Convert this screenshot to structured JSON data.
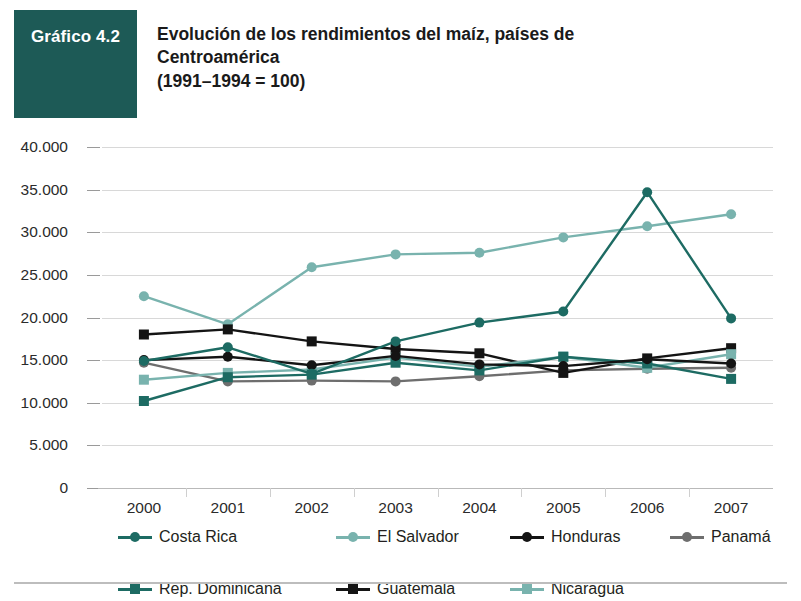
{
  "header": {
    "badge_label": "Gráfico 4.2",
    "title": "Evolución de los rendimientos del maíz, países de\nCentroamérica\n(1991–1994 = 100)",
    "badge_bg": "#1d5a56",
    "title_color": "#1a1a1a"
  },
  "colors": {
    "dark_teal": "#1d6b63",
    "light_teal": "#79b3ae",
    "black": "#141414",
    "gray": "#6e6e6e",
    "grid": "#d8d8d8",
    "axis": "#b9b9b9"
  },
  "chart_data": {
    "type": "line",
    "title": "Evolución de los rendimientos del maíz, países de Centroamérica (1991–1994 = 100)",
    "xlabel": "",
    "ylabel": "",
    "x": [
      "2000",
      "2001",
      "2002",
      "2003",
      "2004",
      "2005",
      "2006",
      "2007"
    ],
    "categories": [
      "2000",
      "2001",
      "2002",
      "2003",
      "2004",
      "2005",
      "2006",
      "2007"
    ],
    "ylim": [
      0,
      40000
    ],
    "yticks": [
      0,
      5000,
      10000,
      15000,
      20000,
      25000,
      30000,
      35000,
      40000
    ],
    "ytick_labels": [
      "0",
      "5.000",
      "10.000",
      "15.000",
      "20.000",
      "25.000",
      "30.000",
      "35.000",
      "40.000"
    ],
    "grid": true,
    "legend_position": "bottom",
    "series": [
      {
        "name": "Costa Rica",
        "color": "#1d6b63",
        "marker": "circle",
        "values": [
          14900,
          16500,
          13400,
          17200,
          19400,
          20700,
          34700,
          19900
        ]
      },
      {
        "name": "El Salvador",
        "color": "#79b3ae",
        "marker": "circle",
        "values": [
          22500,
          19200,
          25900,
          27400,
          27600,
          29400,
          30700,
          32100
        ]
      },
      {
        "name": "Honduras",
        "color": "#141414",
        "marker": "circle",
        "values": [
          15000,
          15400,
          14400,
          15500,
          14500,
          14300,
          15100,
          14600
        ]
      },
      {
        "name": "Panamá",
        "color": "#6e6e6e",
        "marker": "circle",
        "values": [
          14700,
          12500,
          12600,
          12500,
          13100,
          13800,
          14000,
          14100
        ]
      },
      {
        "name": "Rep. Dominicana",
        "color": "#1d6b63",
        "marker": "square",
        "values": [
          10200,
          13000,
          13300,
          14700,
          13800,
          15400,
          14600,
          12800
        ]
      },
      {
        "name": "Guatemala",
        "color": "#141414",
        "marker": "square",
        "values": [
          18000,
          18600,
          17200,
          16300,
          15800,
          13500,
          15200,
          16400
        ]
      },
      {
        "name": "Nicaragua",
        "color": "#79b3ae",
        "marker": "square",
        "values": [
          12700,
          13500,
          13900,
          15300,
          14200,
          15400,
          14100,
          15700
        ]
      }
    ]
  }
}
